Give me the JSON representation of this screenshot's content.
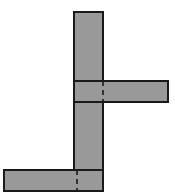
{
  "figure": {
    "canvas": {
      "width": 175,
      "height": 193,
      "background": "#fefefe"
    },
    "style": {
      "fill": "#999999",
      "stroke": "#1a1a1a",
      "stroke_width": 1.5,
      "hidden_edge_stroke": "#1a1a1a",
      "hidden_edge_width": 1.6,
      "hidden_edge_dash": "5,4"
    },
    "shapes": [
      {
        "name": "vertical-column",
        "label": "Vertical column",
        "type": "rect",
        "x": 74,
        "y": 12,
        "width": 29,
        "height": 179
      },
      {
        "name": "right-beam",
        "label": "Right horizontal beam",
        "type": "rect",
        "x": 74,
        "y": 81,
        "width": 94,
        "height": 21
      },
      {
        "name": "bottom-left-beam",
        "label": "Bottom left horizontal beam",
        "type": "rect",
        "x": 4,
        "y": 170,
        "width": 99,
        "height": 21
      }
    ],
    "hidden_edges": [
      {
        "name": "upper-junction-top-edge",
        "label": "Upper junction top hidden edge",
        "type": "line",
        "x1": 74,
        "y1": 81,
        "x2": 103,
        "y2": 81
      },
      {
        "name": "upper-junction-bottom-edge",
        "label": "Upper junction bottom hidden edge",
        "type": "line",
        "x1": 74,
        "y1": 102,
        "x2": 103,
        "y2": 102
      },
      {
        "name": "upper-junction-right-edge",
        "label": "Upper junction vertical hidden edge",
        "type": "line",
        "x1": 103,
        "y1": 81,
        "x2": 103,
        "y2": 102
      },
      {
        "name": "lower-junction-top-edge",
        "label": "Lower junction top hidden edge",
        "type": "line",
        "x1": 74,
        "y1": 170,
        "x2": 103,
        "y2": 170
      },
      {
        "name": "lower-junction-left-edge",
        "label": "Lower junction vertical hidden edge",
        "type": "line",
        "x1": 77,
        "y1": 170,
        "x2": 77,
        "y2": 191
      }
    ]
  }
}
